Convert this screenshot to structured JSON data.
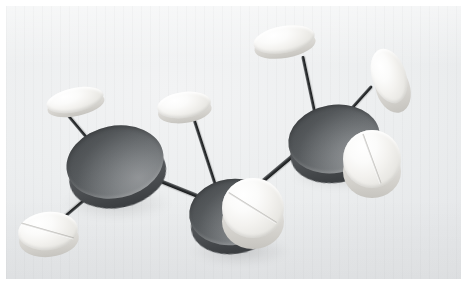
{
  "image": {
    "title": "Molecular model built from pharmaceutical tablets",
    "subject": "ball-and-stick molecule model",
    "medium": "photograph",
    "border_color": "#ffffff",
    "background_color": "#ebedee",
    "background_description": "plain light grey studio backdrop with faint vertical banding"
  },
  "palette": {
    "carbon_light": "#8d9093",
    "carbon_mid": "#6a6e71",
    "carbon_dark": "#45484b",
    "hydrogen_light": "#ffffff",
    "hydrogen_mid": "#f3f2ef",
    "hydrogen_rim": "#cfcdc8",
    "bond_color": "#17191a"
  },
  "model": {
    "description": "Three dark grey discs (carbon atoms) joined in a chain, each bonded by thin dark rods to white scored tablets (hydrogen atoms).",
    "carbon_count": 3,
    "hydrogen_count": 6,
    "bond_count": 8
  },
  "atoms": [
    {
      "id": "carbon-1",
      "label": "C1",
      "kind": "carbon",
      "color": "#6a6e71",
      "x": 66,
      "y": 126,
      "w": 98,
      "h": 72,
      "rot": -12,
      "z": 6,
      "scored": false,
      "score_rot": 0
    },
    {
      "id": "carbon-2",
      "label": "C2",
      "kind": "carbon",
      "color": "#6a6e71",
      "x": 189,
      "y": 179,
      "w": 86,
      "h": 66,
      "rot": -8,
      "z": 5,
      "scored": false,
      "score_rot": 0
    },
    {
      "id": "carbon-3",
      "label": "C3",
      "kind": "carbon",
      "color": "#6a6e71",
      "x": 288,
      "y": 105,
      "w": 92,
      "h": 68,
      "rot": -10,
      "z": 6,
      "scored": false,
      "score_rot": 0
    },
    {
      "id": "hydrogen-1",
      "label": "H1",
      "kind": "hydrogen",
      "color": "#f3f2ef",
      "x": 46,
      "y": 88,
      "w": 58,
      "h": 24,
      "rot": -12,
      "z": 7,
      "scored": false,
      "score_rot": 0
    },
    {
      "id": "hydrogen-2",
      "label": "H2",
      "kind": "hydrogen",
      "color": "#f3f2ef",
      "x": 18,
      "y": 212,
      "w": 60,
      "h": 38,
      "rot": -6,
      "z": 8,
      "scored": true,
      "score_rot": 22
    },
    {
      "id": "hydrogen-3",
      "label": "H3",
      "kind": "hydrogen",
      "color": "#f3f2ef",
      "x": 157,
      "y": 92,
      "w": 54,
      "h": 26,
      "rot": -8,
      "z": 7,
      "scored": false,
      "score_rot": 0
    },
    {
      "id": "hydrogen-4",
      "label": "H4",
      "kind": "hydrogen",
      "color": "#f3f2ef",
      "x": 222,
      "y": 178,
      "w": 62,
      "h": 60,
      "rot": 0,
      "z": 9,
      "scored": true,
      "score_rot": 32
    },
    {
      "id": "hydrogen-5",
      "label": "H5",
      "kind": "hydrogen",
      "color": "#f3f2ef",
      "x": 253,
      "y": 26,
      "w": 62,
      "h": 27,
      "rot": -10,
      "z": 7,
      "scored": false,
      "score_rot": 0
    },
    {
      "id": "hydrogen-6",
      "label": "H6",
      "kind": "hydrogen",
      "color": "#f3f2ef",
      "x": 372,
      "y": 48,
      "w": 34,
      "h": 56,
      "rot": -18,
      "z": 7,
      "scored": false,
      "score_rot": 0
    },
    {
      "id": "hydrogen-7",
      "label": "H7",
      "kind": "hydrogen",
      "color": "#f3f2ef",
      "x": 343,
      "y": 130,
      "w": 58,
      "h": 58,
      "rot": 0,
      "z": 8,
      "scored": true,
      "score_rot": 70
    }
  ],
  "bonds": [
    {
      "id": "bond-c1-h1",
      "x": 99,
      "y": 152,
      "len": 48,
      "rot": -130,
      "thick": 3
    },
    {
      "id": "bond-c1-h2",
      "x": 96,
      "y": 190,
      "len": 56,
      "rot": 140,
      "thick": 3
    },
    {
      "id": "bond-c1-c2",
      "x": 153,
      "y": 178,
      "len": 62,
      "rot": 22,
      "thick": 4
    },
    {
      "id": "bond-c2-h3",
      "x": 218,
      "y": 193,
      "len": 88,
      "rot": -108,
      "thick": 3
    },
    {
      "id": "bond-c2-c3",
      "x": 252,
      "y": 190,
      "len": 82,
      "rot": -40,
      "thick": 4
    },
    {
      "id": "bond-c3-h5",
      "x": 318,
      "y": 128,
      "len": 74,
      "rot": -102,
      "thick": 3
    },
    {
      "id": "bond-c3-h6",
      "x": 337,
      "y": 124,
      "len": 52,
      "rot": -48,
      "thick": 3
    },
    {
      "id": "bond-c3-h7",
      "x": 344,
      "y": 140,
      "len": 22,
      "rot": 18,
      "thick": 3
    }
  ],
  "shadows": [
    {
      "id": "shadow-c1",
      "x": 62,
      "y": 186,
      "w": 110,
      "h": 34
    },
    {
      "id": "shadow-c2",
      "x": 190,
      "y": 236,
      "w": 100,
      "h": 30
    },
    {
      "id": "shadow-c3",
      "x": 290,
      "y": 160,
      "w": 100,
      "h": 30
    }
  ]
}
